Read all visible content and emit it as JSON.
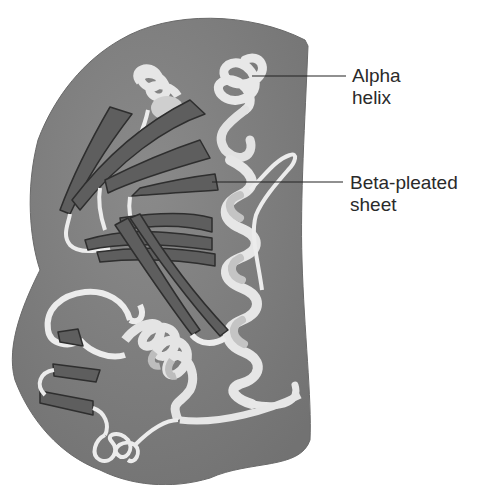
{
  "figure": {
    "colors": {
      "background": "#ffffff",
      "globule": "#7d7d7d",
      "globule_edge": "#6a6a6a",
      "helix_ribbon": "#e8e8e8",
      "helix_shadow": "#c4c4c4",
      "beta_strand": "#5e5e5e",
      "beta_edge": "#2e2e2e",
      "leader_line": "#222222",
      "label_text": "#2a2a2a"
    },
    "labels": [
      {
        "id": "alpha-helix",
        "line1": "Alpha",
        "line2": "helix"
      },
      {
        "id": "beta-sheet",
        "line1": "Beta-pleated",
        "line2": "sheet"
      }
    ]
  }
}
